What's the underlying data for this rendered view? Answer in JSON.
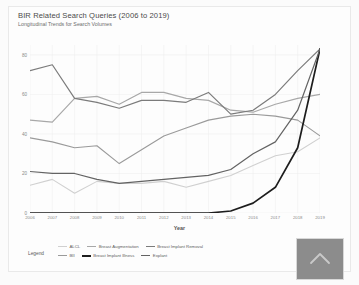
{
  "chart_data": {
    "type": "line",
    "title": "BIR Related Search Queries (2006 to 2019)",
    "subtitle": "Longitudinal Trends for Search Volumes",
    "xlabel": "Year",
    "ylabel": "",
    "grid": true,
    "legend_position": "bottom-left",
    "legend_label": "Legend",
    "xlim": [
      2006,
      2019
    ],
    "ylim": [
      0,
      85
    ],
    "yticks": [
      0,
      20,
      40,
      60,
      80
    ],
    "ytick_labels": [
      "0",
      "20",
      "40",
      "60",
      "80"
    ],
    "categories": [
      2006,
      2007,
      2008,
      2009,
      2010,
      2011,
      2012,
      2013,
      2014,
      2015,
      2016,
      2017,
      2018,
      2019
    ],
    "xtick_labels": [
      "2006",
      "2007",
      "2008",
      "2009",
      "2010",
      "2011",
      "2012",
      "2013",
      "2014",
      "2015",
      "2016",
      "2017",
      "2018",
      "2019"
    ],
    "series": [
      {
        "name": "ALCL",
        "color": "#d0d0d0",
        "width": 1.1,
        "values": [
          14,
          17,
          10,
          16,
          15,
          15,
          16,
          13,
          16,
          19,
          24,
          29,
          31,
          38
        ]
      },
      {
        "name": "Breast Augmentation",
        "color": "#a8a8a8",
        "width": 1.2,
        "values": [
          47,
          46,
          58,
          59,
          55,
          61,
          61,
          58,
          57,
          52,
          51,
          55,
          58,
          60
        ]
      },
      {
        "name": "Breast Implant Removal",
        "color": "#7b7b7b",
        "width": 1.2,
        "values": [
          72,
          75,
          58,
          56,
          53,
          57,
          57,
          56,
          61,
          50,
          52,
          60,
          72,
          83
        ]
      },
      {
        "name": "BII",
        "color": "#9a9a9a",
        "width": 1.1,
        "values": [
          38,
          36,
          33,
          34,
          25,
          32,
          39,
          43,
          47,
          49,
          50,
          49,
          47,
          39
        ]
      },
      {
        "name": "Breast Implant Illness",
        "color": "#1d1d1d",
        "width": 1.7,
        "values": [
          0,
          0,
          0,
          0,
          0,
          0,
          0,
          0,
          0,
          1,
          5,
          13,
          33,
          83
        ]
      },
      {
        "name": "Explant",
        "color": "#636363",
        "width": 1.2,
        "values": [
          21,
          20,
          20,
          17,
          15,
          16,
          17,
          18,
          19,
          22,
          30,
          36,
          52,
          83
        ]
      }
    ]
  },
  "thumbnail": {
    "icon": "chevron-up-icon"
  }
}
